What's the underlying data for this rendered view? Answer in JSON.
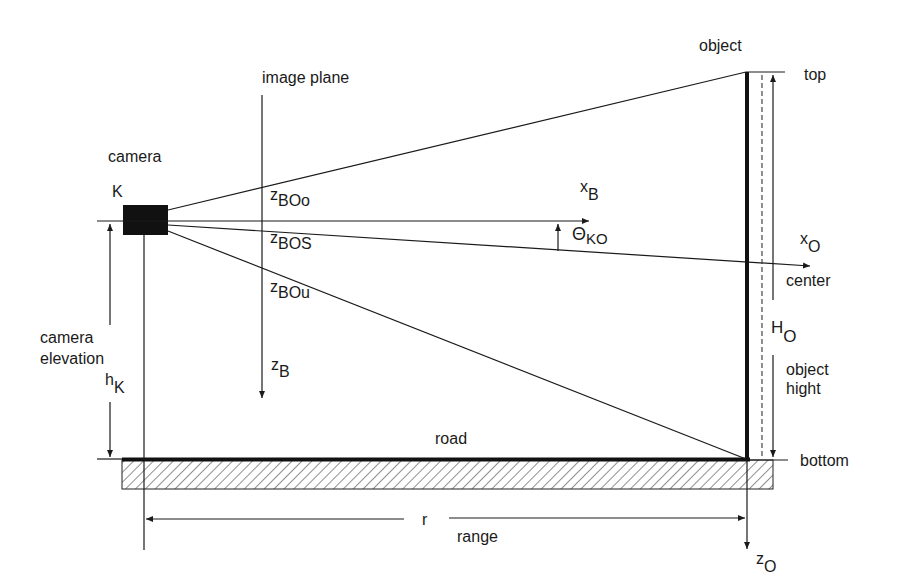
{
  "diagram": {
    "labels": {
      "camera": "camera",
      "camera_symbol": "K",
      "image_plane": "image plane",
      "object": "object",
      "top": "top",
      "center": "center",
      "bottom": "bottom",
      "road": "road",
      "range_symbol": "r",
      "range": "range",
      "camera_elevation_line1": "camera",
      "camera_elevation_line2": "elevation",
      "object_height_line1": "object",
      "object_height_line2": "hight"
    },
    "symbols": {
      "z_BOo": {
        "base": "z",
        "sub": "BOo"
      },
      "z_BOS": {
        "base": "z",
        "sub": "BOS"
      },
      "z_BOu": {
        "base": "z",
        "sub": "BOu"
      },
      "z_B": {
        "base": "z",
        "sub": "B"
      },
      "x_B": {
        "base": "x",
        "sub": "B"
      },
      "theta_KO": {
        "base": "Θ",
        "sub": "KO"
      },
      "x_O": {
        "base": "x",
        "sub": "O"
      },
      "z_O": {
        "base": "z",
        "sub": "O"
      },
      "H_O": {
        "base": "H",
        "sub": "O"
      },
      "h_K": {
        "base": "h",
        "sub": "K"
      }
    },
    "colors": {
      "ink": "#1a1a1a",
      "background": "#ffffff"
    }
  }
}
